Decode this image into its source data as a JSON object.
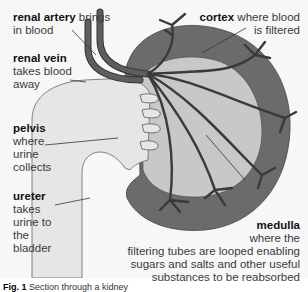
{
  "diagram": {
    "title": "Section through a kidney",
    "colors": {
      "background": "#f7f7f7",
      "cortex": "#6b6b6b",
      "medulla": "#c8c8c8",
      "pelvis_ureter": "#e6e6e6",
      "vessels": "#5a5a5a",
      "vessel_outline": "#333333",
      "leader_lines": "#333333"
    },
    "labels": {
      "renal_artery": {
        "term": "renal artery",
        "desc": "brings in blood"
      },
      "renal_vein": {
        "term": "renal vein",
        "desc": "takes blood away"
      },
      "pelvis": {
        "term": "pelvis",
        "desc": "where urine collects"
      },
      "ureter": {
        "term": "ureter",
        "desc": "takes urine to the bladder"
      },
      "cortex": {
        "term": "cortex",
        "desc": "where blood is filtered"
      },
      "medulla": {
        "term": "medulla",
        "desc": "where the filtering tubes are looped enabling sugars and salts and other useful substances to be reabsorbed"
      }
    },
    "label_lines": {
      "renal_artery": [
        "renal artery",
        " brings",
        "in blood"
      ],
      "renal_vein": [
        "renal vein",
        "takes blood",
        "away"
      ],
      "pelvis": [
        "pelvis",
        "where",
        "urine",
        "collects"
      ],
      "ureter": [
        "ureter",
        "takes",
        "urine to",
        "the",
        "bladder"
      ],
      "cortex": [
        "cortex",
        " where blood",
        "is filtered"
      ],
      "medulla": [
        "medulla",
        "where the",
        "filtering tubes are looped enabling",
        "sugars and salts and other useful",
        "substances to be reabsorbed"
      ]
    },
    "caption": {
      "fig": "Fig. 1",
      "text": " Section through a kidney"
    }
  }
}
